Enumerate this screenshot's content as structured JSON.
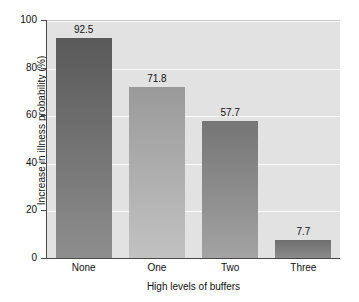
{
  "chart_data": {
    "type": "bar",
    "title": "",
    "subtitle": "",
    "xlabel": "High levels of buffers",
    "ylabel": "Increase in illness probability (%)",
    "categories": [
      "None",
      "One",
      "Two",
      "Three"
    ],
    "values": [
      92.5,
      71.8,
      57.7,
      7.7
    ],
    "value_labels": [
      "92.5",
      "71.8",
      "57.7",
      "7.7"
    ],
    "ylim": [
      0,
      100
    ],
    "yticks": [
      0,
      20,
      40,
      60,
      80,
      100
    ],
    "ytick_labels": [
      "0",
      "20",
      "40",
      "60",
      "80",
      "100"
    ],
    "grid": "horizontal",
    "legend": "none",
    "annotations": [],
    "series": [
      {
        "name": "Increase in illness probability",
        "values": [
          92.5,
          71.8,
          57.7,
          7.7
        ]
      }
    ],
    "bar_colors": [
      "#595959",
      "#9a9a9a",
      "#757575",
      "#6e6e6e"
    ],
    "bar_gradient_bottom_colors": [
      "#8e8e8e",
      "#c2c2c2",
      "#a3a3a3",
      "#8b8b8b"
    ],
    "plot_background": "#e2e2e2",
    "gridline_color": "#fafafa",
    "axis_color": "#4a4a4a",
    "figure_background": "#ffffff"
  }
}
